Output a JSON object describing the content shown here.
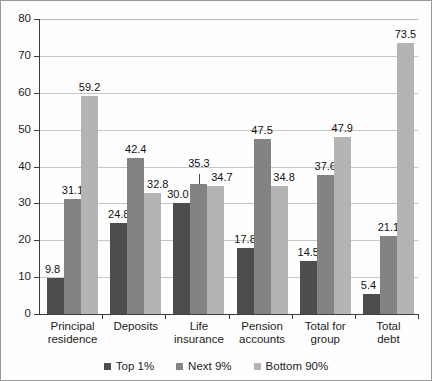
{
  "chart_data": {
    "type": "bar",
    "title": "",
    "subtitle": "",
    "xlabel": "",
    "ylabel": "",
    "ylim": [
      0,
      80
    ],
    "yticks": [
      0,
      10,
      20,
      30,
      40,
      50,
      60,
      70,
      80
    ],
    "grid": true,
    "legend_position": "bottom",
    "categories": [
      "Principal\nresidence",
      "Deposits",
      "Life\ninsurance",
      "Pension\naccounts",
      "Total for\ngroup",
      "Total\ndebt"
    ],
    "series": [
      {
        "name": "Top 1%",
        "color": "#4d4d4d",
        "values": [
          9.8,
          24.8,
          30.0,
          17.8,
          14.5,
          5.4
        ]
      },
      {
        "name": "Next 9%",
        "color": "#838383",
        "values": [
          31.1,
          42.4,
          35.3,
          47.5,
          37.6,
          21.1
        ]
      },
      {
        "name": "Bottom 90%",
        "color": "#b4b4b4",
        "values": [
          59.2,
          32.8,
          34.7,
          34.8,
          47.9,
          73.5
        ]
      }
    ],
    "data_labels": [
      [
        "9.8",
        "31.1",
        "59.2"
      ],
      [
        "24.8",
        "42.4",
        "32.8"
      ],
      [
        "30.0",
        "35.3",
        "34.7"
      ],
      [
        "17.8",
        "47.5",
        "34.8"
      ],
      [
        "14.5",
        "37.6",
        "47.9"
      ],
      [
        "5.4",
        "21.1",
        "73.5"
      ]
    ]
  },
  "legend": {
    "items": [
      {
        "label": "Top 1%"
      },
      {
        "label": "Next 9%"
      },
      {
        "label": "Bottom 90%"
      }
    ]
  }
}
